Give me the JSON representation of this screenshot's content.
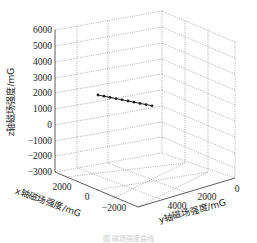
{
  "chart_data": {
    "type": "line3d",
    "title": "",
    "xlabel": "x轴磁场强度/mG",
    "ylabel": "y轴磁场强度/mG",
    "zlabel": "z轴磁场强度/mG",
    "x_ticks": [
      "2000",
      "0",
      "−2000"
    ],
    "y_ticks": [
      "4000",
      "2000",
      "0"
    ],
    "z_ticks": [
      "6000",
      "5000",
      "4000",
      "3000",
      "2000",
      "1000",
      "0",
      "−1000",
      "−2000",
      "−3000"
    ],
    "xlim": [
      -3000,
      3000
    ],
    "ylim": [
      0,
      6000
    ],
    "zlim": [
      -3000,
      6000
    ],
    "grid": true,
    "series": [
      {
        "name": "trajectory",
        "marker": "dot",
        "points_screen": [
          [
            98,
            95
          ],
          [
            104,
            96.2
          ],
          [
            110,
            97.4
          ],
          [
            116,
            98.6
          ],
          [
            122,
            99.8
          ],
          [
            128,
            101
          ],
          [
            134,
            102.2
          ],
          [
            140,
            103.4
          ],
          [
            146,
            104.6
          ],
          [
            152,
            105.8
          ]
        ]
      }
    ]
  },
  "caption": "图 磁场强度曲线"
}
